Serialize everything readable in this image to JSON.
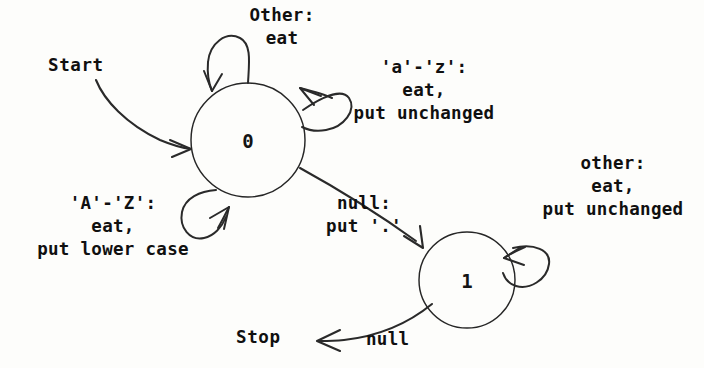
{
  "figure": {
    "kind": "state-transition-diagram",
    "background_color": "#fdfdfb",
    "ink_color": "#1a1a1a",
    "text_color": "#101010"
  },
  "states": [
    {
      "id": "state-0",
      "label": "0",
      "cx": 248,
      "cy": 140,
      "r": 57
    },
    {
      "id": "state-1",
      "label": "1",
      "cx": 467,
      "cy": 280,
      "r": 48
    }
  ],
  "terminals": {
    "start_label": "Start",
    "stop_label": "Stop"
  },
  "transitions": [
    {
      "id": "start-to-0",
      "from": "start",
      "to": "state-0",
      "label": ""
    },
    {
      "id": "loop-0-other",
      "from": "state-0",
      "to": "state-0",
      "label": "Other:\neat"
    },
    {
      "id": "loop-0-lower",
      "from": "state-0",
      "to": "state-0",
      "label": "'a'-'z':\neat,\nput unchanged"
    },
    {
      "id": "loop-0-upper",
      "from": "state-0",
      "to": "state-0",
      "label": "'A'-'Z':\neat,\nput lower case"
    },
    {
      "id": "edge-0-to-1",
      "from": "state-0",
      "to": "state-1",
      "label": "null:\nput '.'"
    },
    {
      "id": "loop-1-other",
      "from": "state-1",
      "to": "state-1",
      "label": "other:\neat,\nput unchanged"
    },
    {
      "id": "edge-1-to-stop",
      "from": "state-1",
      "to": "stop",
      "label": "null"
    }
  ]
}
